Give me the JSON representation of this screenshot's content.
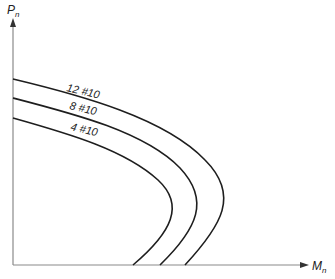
{
  "diagram": {
    "type": "interaction-diagram",
    "y_axis": {
      "label": "P",
      "subscript": "n"
    },
    "x_axis": {
      "label": "M",
      "subscript": "n"
    },
    "curves": [
      {
        "label": "12 #10",
        "path": "M13,79 C80,95 165,118 205,160 C240,195 222,225 185,265"
      },
      {
        "label": "8 #10",
        "path": "M13,98 C75,114 145,132 180,168 C210,200 198,228 160,265"
      },
      {
        "label": "4 #10",
        "path": "M13,118 C70,134 125,150 158,180 C185,205 172,232 133,265"
      }
    ],
    "colors": {
      "axis": "#8a8a8a",
      "curve": "#1e1e1e",
      "text": "#222222"
    }
  }
}
